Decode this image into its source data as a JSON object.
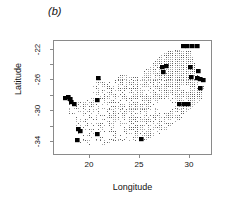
{
  "figure": {
    "panel_label": "(b)",
    "axes": {
      "x_title": "Longitude",
      "y_title": "Latitude",
      "x_ticks": [
        20,
        25,
        30
      ],
      "y_ticks": [
        -22,
        -26,
        -30,
        -34
      ],
      "x_tick_labels": [
        "20",
        "25",
        "30"
      ],
      "y_tick_labels": [
        "-22",
        "-26",
        "-30",
        "-34"
      ],
      "xlim": [
        15.6,
        33.5
      ],
      "ylim": [
        -35.8,
        -21.2
      ]
    },
    "colors": {
      "frame": "#8a8a8a",
      "grid_dot": "#5a5a5a",
      "presence": "#000000",
      "background": "#ffffff",
      "text": "#111111"
    }
  },
  "chart_data": {
    "type": "scatter",
    "title": "(b)",
    "xlabel": "Longitude",
    "ylabel": "Latitude",
    "xlim": [
      15.6,
      33.5
    ],
    "ylim": [
      -35.8,
      -21.2
    ],
    "grid": false,
    "legend": null,
    "series": [
      {
        "name": "surveyed grid cells",
        "marker": "small-dot",
        "color": "#5a5a5a",
        "cell_size": 0.25,
        "note": "Regular 0.25-degree lattice of small dots filling the national boundary; density highest in the north-east interior."
      },
      {
        "name": "presence records",
        "marker": "filled-square",
        "color": "#000000",
        "cell_size": 0.45,
        "points": [
          [
            30.3,
            -21.9
          ],
          [
            30.8,
            -21.8
          ],
          [
            31.4,
            -21.8
          ],
          [
            31.9,
            -21.9
          ],
          [
            28.0,
            -24.6
          ],
          [
            28.4,
            -24.5
          ],
          [
            28.1,
            -25.2
          ],
          [
            31.1,
            -24.6
          ],
          [
            32.0,
            -25.1
          ],
          [
            31.3,
            -25.8
          ],
          [
            31.9,
            -26.0
          ],
          [
            32.3,
            -26.1
          ],
          [
            32.6,
            -26.3
          ],
          [
            32.3,
            -27.3
          ],
          [
            20.6,
            -26.0
          ],
          [
            16.9,
            -28.6
          ],
          [
            17.2,
            -28.5
          ],
          [
            17.5,
            -28.7
          ],
          [
            17.6,
            -29.1
          ],
          [
            17.9,
            -29.4
          ],
          [
            20.5,
            -28.8
          ],
          [
            29.9,
            -29.3
          ],
          [
            30.4,
            -29.4
          ],
          [
            30.9,
            -29.3
          ],
          [
            18.4,
            -32.6
          ],
          [
            18.6,
            -32.8
          ],
          [
            18.3,
            -34.0
          ],
          [
            20.5,
            -33.2
          ],
          [
            25.6,
            -33.9
          ]
        ]
      }
    ]
  }
}
